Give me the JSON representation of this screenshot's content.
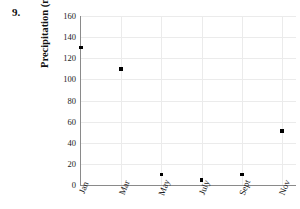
{
  "question": {
    "number": "9."
  },
  "chart_data": {
    "type": "scatter",
    "title": "",
    "xlabel": "",
    "ylabel": "Precipitation (mm)",
    "categories": [
      "Jan",
      "Mar",
      "May",
      "July",
      "Sept",
      "Nov"
    ],
    "values": [
      130,
      110,
      10,
      5,
      10,
      51
    ],
    "series": [
      {
        "name": "Precipitation",
        "values": [
          130,
          110,
          10,
          5,
          10,
          51
        ]
      }
    ],
    "ylim": [
      0,
      160
    ],
    "ytick_labels": [
      "160",
      "140",
      "120",
      "100",
      "80",
      "60",
      "40",
      "20",
      "0"
    ],
    "ytick_values": [
      160,
      140,
      120,
      100,
      80,
      60,
      40,
      20,
      0
    ],
    "grid": true,
    "legend": "none",
    "marker": "filled-square",
    "marker_color": "#000000",
    "grid_color": "#ebebeb",
    "axis_color": "#8a8a8a",
    "background": "#ffffff"
  }
}
